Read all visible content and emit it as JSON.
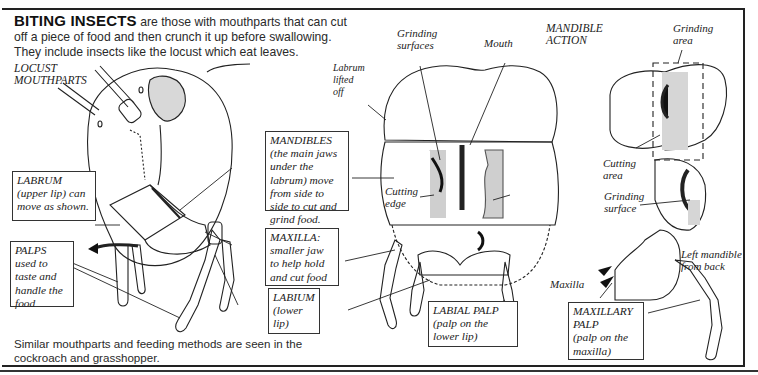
{
  "intro": {
    "heading": "BITING INSECTS",
    "text": " are those with mouthparts that can cut off a piece of food and then crunch it up before swallowing. They include insects like the locust which eat leaves."
  },
  "footer": {
    "text": "Similar mouthparts and feeding methods are seen in the cockroach and grasshopper."
  },
  "figures": {
    "locust": {
      "title": "LOCUST\nMOUTHPARTS",
      "boxes": {
        "labrum": {
          "term": "LABRUM",
          "desc": " (upper lip) can move as shown."
        },
        "palps": {
          "term": "PALPS",
          "desc": " used to taste and handle the food"
        },
        "mandibles": {
          "term": "MANDIBLES",
          "desc": " (the main jaws under the labrum) move from side to side to cut and grind food."
        },
        "maxilla": {
          "term": "MAXILLA:",
          "desc": " smaller jaw to help hold and cut food"
        },
        "labium": {
          "term": "LABIUM",
          "desc": " (lower lip)"
        }
      }
    },
    "head_front": {
      "labels": {
        "labrum_lifted": "Labrum\nlifted\noff",
        "grinding_surfaces": "Grinding\nsurfaces",
        "mouth": "Mouth",
        "cutting_edge": "Cutting\nedge"
      },
      "boxes": {
        "labial_palp": {
          "term": "LABIAL PALP",
          "desc": "(palp on the lower lip)"
        }
      }
    },
    "mandible_action": {
      "title": "MANDIBLE\nACTION",
      "labels": {
        "grinding_area": "Grinding\narea",
        "cutting_area": "Cutting\narea",
        "grinding_surface": "Grinding\nsurface",
        "left_mandible": "Left mandible\nfrom back",
        "maxilla": "Maxilla"
      },
      "boxes": {
        "maxillary_palp": {
          "term": "MAXILLARY PALP",
          "desc": "(palp on the maxilla)"
        }
      }
    }
  }
}
